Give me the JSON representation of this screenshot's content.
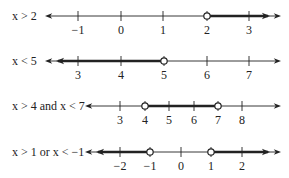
{
  "lines": [
    {
      "label": "x > 2",
      "y": 16,
      "x_start": 45,
      "x_end": 281,
      "ticks": [
        {
          "value": "−1",
          "x": 78
        },
        {
          "value": "0",
          "x": 121
        },
        {
          "value": "1",
          "x": 163
        },
        {
          "value": "2",
          "x": 207
        },
        {
          "value": "3",
          "x": 249
        }
      ],
      "open_points": [
        207
      ],
      "shaded": [
        {
          "from": 207,
          "to": 268,
          "arrow": "right"
        }
      ]
    },
    {
      "label": "x < 5",
      "y": 61,
      "x_start": 45,
      "x_end": 281,
      "ticks": [
        {
          "value": "3",
          "x": 78
        },
        {
          "value": "4",
          "x": 121
        },
        {
          "value": "5",
          "x": 164
        },
        {
          "value": "6",
          "x": 207
        },
        {
          "value": "7",
          "x": 249
        }
      ],
      "open_points": [
        164
      ],
      "shaded": [
        {
          "from": 58,
          "to": 164,
          "arrow": "left"
        }
      ]
    },
    {
      "label": "x > 4 and x < 7",
      "y": 106,
      "x_start": 85,
      "x_end": 281,
      "ticks": [
        {
          "value": "3",
          "x": 120
        },
        {
          "value": "4",
          "x": 145
        },
        {
          "value": "5",
          "x": 169
        },
        {
          "value": "6",
          "x": 194
        },
        {
          "value": "7",
          "x": 218
        },
        {
          "value": "8",
          "x": 242
        }
      ],
      "open_points": [
        145,
        218
      ],
      "shaded": [
        {
          "from": 145,
          "to": 218,
          "arrow": "none"
        }
      ]
    },
    {
      "label": "x > 1 or x < −1",
      "y": 152,
      "x_start": 85,
      "x_end": 281,
      "ticks": [
        {
          "value": "−2",
          "x": 120
        },
        {
          "value": "−1",
          "x": 150
        },
        {
          "value": "0",
          "x": 181
        },
        {
          "value": "1",
          "x": 211
        },
        {
          "value": "2",
          "x": 242
        }
      ],
      "open_points": [
        150,
        211
      ],
      "shaded": [
        {
          "from": 98,
          "to": 150,
          "arrow": "left"
        },
        {
          "from": 211,
          "to": 268,
          "arrow": "right"
        }
      ]
    }
  ],
  "colors": {
    "ink": "#222222",
    "circle_fill": "#ffffff"
  }
}
